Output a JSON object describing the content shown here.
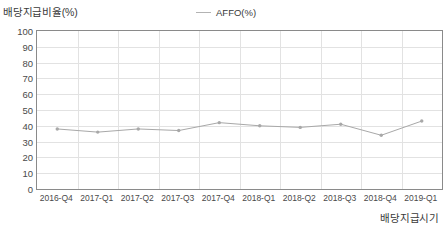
{
  "axis_titles": {
    "y": "배당지급비율(%)",
    "x": "배당지급시기"
  },
  "legend": {
    "entries": [
      {
        "label": "AFFO(%)",
        "color": "#b3b3b3",
        "marker": "line-marker-icon"
      }
    ]
  },
  "chart_data": {
    "type": "line",
    "title": "",
    "subtitle": "",
    "xlabel": "배당지급시기",
    "ylabel": "배당지급비율(%)",
    "ylim": [
      0,
      100
    ],
    "ytick_labels": [
      "100",
      "90",
      "80",
      "70",
      "60",
      "50",
      "40",
      "30",
      "20",
      "10",
      "0"
    ],
    "ytick_values": [
      100,
      90,
      80,
      70,
      60,
      50,
      40,
      30,
      20,
      10,
      0
    ],
    "grid": "horizontal-and-vertical",
    "legend_position": "top-center",
    "categories": [
      "2016-Q4",
      "2017-Q1",
      "2017-Q2",
      "2017-Q3",
      "2017-Q4",
      "2018-Q1",
      "2018-Q2",
      "2018-Q3",
      "2018-Q4",
      "2019-Q1"
    ],
    "series": [
      {
        "name": "AFFO(%)",
        "color": "#a8a8a8",
        "values": [
          38,
          36,
          38,
          37,
          42,
          40,
          39,
          41,
          34,
          43
        ]
      }
    ]
  }
}
